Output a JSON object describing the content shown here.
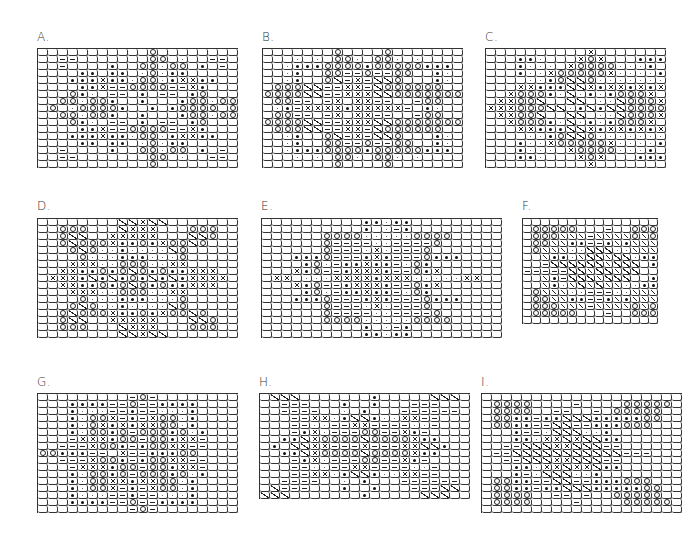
{
  "figure": {
    "panels": [
      {
        "id": "A",
        "label": "A.",
        "x": 37,
        "y": 48,
        "cw": 10,
        "ch": 7,
        "labelX": 37,
        "labelY": 30,
        "rows": [
          "...........o........",
          "..--.......oo.:..--.",
          "..-....*..oo:oo.*.-.",
          "....**.**.:o:**.....",
          "...***x**:oo:*xx**..",
          "....**x--oooo--x*...",
          "...o*:.--.*.--.*o...",
          "..oo:oo*..*...*oo:oo",
          ".o.:oooo*..*.*oooo.o",
          "..oo:oo*..*...*oo:oo",
          "...o*:.--.*.--.*o...",
          "....**x--oooo--x*...",
          "...***x**:oo:*xx**..",
          "....**.**.:o:**.....",
          "..-....*..oo:oo.*.-.",
          "..--.......oo.:..--.",
          "...........o........"
        ]
      },
      {
        "id": "B",
        "label": "B.",
        "x": 262,
        "y": 48,
        "cw": 10,
        "ch": 7,
        "labelX": 262,
        "labelY": 30,
        "rows": [
          ".......o....o.......",
          "...:.:.oo:.oo:.:....",
          "..:***oooo*ooooo***.",
          "..:*..oo--o--oo..*:.",
          "..:*..o/-x-//o...*:.",
          ".ooo//--xx-/oooooo..",
          "oooo//--xxx//ooooooo",
          ".oo--.-x.xx--..-oo..",
          ".:*-xxxx*xxxxx-.*:..",
          ".oo--.-x.xx--..-oo..",
          "oooo//--xxx//ooooooo",
          ".ooo//--xx-/oooooo..",
          "..:*..o/-x-//o...*:.",
          "..:*..oo--o--oo..*:.",
          "..:***oooo*ooooo***.",
          "...:.:.oo:.oo:.:....",
          ".......o....o......."
        ]
      },
      {
        "id": "C",
        "label": "C.",
        "x": 485,
        "y": 48,
        "cw": 10,
        "ch": 7,
        "labelX": 485,
        "labelY": 30,
        "rows": [
          "..........x.......",
          "...**:...xox...***",
          "...*:::.xoooo:::*.",
          "...*::xooooox::::*",
          "....::*o//o:::::::",
          "...xx***//x*xx*x*x",
          "..xooo*:/:*:*ooox.",
          ".xxoo/..//.::/ooox",
          "xxxooo//:*/*//oooo",
          ".xxoo/..//.::/ooox",
          "..xooo*:/:*:*ooox.",
          "...xx***//x*xx*x*x",
          "....::*o//o:::::::",
          "...*::xooooox::::*",
          "...*:::.xoooo:::*.",
          "...**:...xox...***",
          "..........x......."
        ]
      },
      {
        "id": "D",
        "label": "D.",
        "x": 37,
        "y": 218,
        "cw": 10,
        "ch": 7,
        "labelX": 37,
        "labelY": 199,
        "rows": [
          "........//x//.......",
          "..ooo.../xxx...ooo..",
          "..o//..xxxxx...//o..",
          "..o/ooox**o*xoo/o...",
          "...o/o::*::::/o.....",
          "....o:::***:::o.....",
          "...xxx::ooo::xx.....",
          "..xx**o*o/o*o**xxx..",
          ".xxx*/*/*o*/*/*xxxx.",
          "..xx**o*o/o*o**xxx..",
          "...xxx::ooo::xx.....",
          "....o:::***:::o.....",
          "...o/o::*::::/o.....",
          "..o/ooox**o*xoo/o...",
          "..o//..xxxxx...//o..",
          "..ooo.../xxx...ooo..",
          "........//x//......."
        ]
      },
      {
        "id": "E",
        "label": "E.",
        "x": 261,
        "y": 218,
        "cw": 10,
        "ch": 7,
        "labelX": 261,
        "labelY": 199,
        "rows": [
          "..........**:**.........",
          "..........*.:-*.........",
          "......oooo:::::oooo.....",
          "......o----::----o......",
          "......o---:x:---o.......",
          "...***o---*x*---o***....",
          "....*o:-**x**-:o*.......",
          "...x*o--*xxx*--o*x......",
          ".xx.:::xxxx*xxx:::::xx..",
          "...x*o--*xxx*--o*x......",
          "....*o:-**x**-:o*.......",
          "...***o---*x*---o***....",
          "......o---:x:---o.......",
          "......o----::----o......",
          "......oooo:::::oooo.....",
          "..........*.:-*.........",
          "..........**:**........."
        ]
      },
      {
        "id": "F",
        "label": "F.",
        "x": 522,
        "y": 218,
        "cw": 9,
        "ch": 7,
        "labelX": 522,
        "labelY": 199,
        "rows": [
          "...............",
          ".ooooo...-..ooo",
          ".oooxxx-xxxxoxo",
          ".ooxx**--*x*xxx",
          ".oxxx::///::xxx",
          "..x**:x//x//:**",
          "..-//////x///.*",
          "-----//x//x//..",
          "..x*-///x///..*",
          "..x*:x/x/xx::**",
          ".oxxx::---::xxx",
          ".ooxx**--*x*xxx",
          ".oooxxx-xxxxoxo",
          ".ooooo...-..ooo",
          "..............."
        ]
      },
      {
        "id": "G",
        "label": "G.",
        "x": 37,
        "y": 393,
        "cw": 10,
        "ch": 7,
        "labelX": 37,
        "labelY": 375,
        "rows": [
          ".........-o-........",
          "...****--o--****....",
          "...*:::--*--:::*....",
          "...*:oox-*-xoo:*....",
          "...*:ox*x*xxoo:*....",
          "...*:oo*o-ooo*o:*...",
          "...-xxx*oo-oo*xx-...",
          "..---xoo*-*ooxx--...",
          "oo***--.x--***oo....",
          "..---xoo*-*ooxx--...",
          "...-xxx*oo-oo*xx-...",
          "...*:oo*o-ooo*o:*...",
          "...*:ooxx*xxoo:*....",
          "...*:oox-*-xoo:*....",
          "...*:::--*--:::*....",
          "...****--o--****....",
          ".........-o-........"
        ]
      },
      {
        "id": "H",
        "label": "H.",
        "x": 259,
        "y": 393,
        "cw": 10,
        "ch": 7,
        "labelX": 259,
        "labelY": 375,
        "rows": [
          ".///.......*.....///.",
          "..---...*..*...---...",
          "..----..:.*...------.",
          "...--xx:*//*::xx--...",
          "...--::--xx----::-...",
          "...-*x:---oo--x*-....",
          "..**/xoooo/oooox**...",
          ".*.//xx---x---xx//*..",
          "..**/xoooo/oooox**...",
          "...-*x:---oo--x*-....",
          "...--::--xx----::-...",
          "...--xx:*//*::xx--...",
          "..----..:.*...------.",
          "./---...*..*...---//.",
          "///.......*.....///.."
        ]
      },
      {
        "id": "I",
        "label": "I.",
        "x": 481,
        "y": 393,
        "cw": 10,
        "ch": 7,
        "labelX": 481,
        "labelY": 375,
        "rows": [
          "....................",
          ".oooo....-....ooooo.",
          ".oooo..--..-.ooooo..",
          ".oo**-**///*****oo..",
          ".oo**--//--***ooo...",
          "...*--:///::*.......",
          "...**:xx/x//**......",
          "..--///xx///--......",
          ".--///////////---...",
          "..--///xx///--......",
          "...**:xx/xx/**......",
          "...*-:///::*........",
          ".oo**--//--***ooo...",
          ".oo**-**///*****oo..",
          ".oooo..--.-..ooooo..",
          ".oooo....-....ooooo.",
          "...................."
        ]
      }
    ],
    "legend_symbols": {
      ".": "empty",
      "o": "open-circle",
      "*": "filled-dot",
      ":": "small-dot",
      "-": "dash",
      "x": "cross",
      "/": "diagonal-slash"
    },
    "colors": {
      "line": "#333333",
      "background": "#ffffff"
    }
  }
}
